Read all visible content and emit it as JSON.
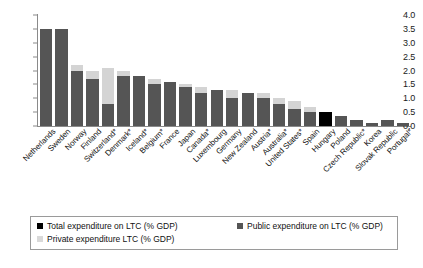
{
  "chart_data": {
    "type": "bar",
    "title": "",
    "xlabel": "",
    "ylabel": "",
    "ylim": [
      0.0,
      4.0
    ],
    "ytick_labels": [
      "4.0",
      "3.5",
      "3.0",
      "2.5",
      "2.0",
      "1.5",
      "1.0",
      "0.5",
      "0.0"
    ],
    "ytick_values": [
      4.0,
      3.5,
      3.0,
      2.5,
      2.0,
      1.5,
      1.0,
      0.5,
      0.0
    ],
    "grid": false,
    "stacked": true,
    "legend_position": "bottom",
    "categories": [
      "Netherlands",
      "Sweden",
      "Norway",
      "Finland",
      "Switzerland*",
      "Denmark*",
      "Iceland*",
      "Belgium*",
      "France",
      "Japan",
      "Canada*",
      "Luxembourg",
      "Germany",
      "New Zealand",
      "Austria*",
      "Australia*",
      "United States*",
      "Spain",
      "Hungary",
      "Poland",
      "Czech Republic*",
      "Korea",
      "Slovak Republic",
      "Portugal*"
    ],
    "series": [
      {
        "name": "Public expenditure on LTC (% GDP)",
        "color": "#555555",
        "values": [
          3.5,
          3.5,
          2.0,
          1.7,
          0.8,
          1.8,
          1.8,
          1.5,
          1.6,
          1.4,
          1.2,
          1.3,
          1.0,
          1.2,
          1.0,
          0.8,
          0.6,
          0.5,
          null,
          0.35,
          0.2,
          0.1,
          0.2,
          0.1
        ]
      },
      {
        "name": "Private expenditure LTC (% GDP)",
        "color": "#d4d4d4",
        "values": [
          0.0,
          0.0,
          0.2,
          0.3,
          1.3,
          0.2,
          0.0,
          0.2,
          0.0,
          0.1,
          0.2,
          0.0,
          0.3,
          0.0,
          0.2,
          0.2,
          0.3,
          0.2,
          null,
          0.0,
          0.0,
          0.0,
          0.0,
          0.0
        ]
      },
      {
        "name": "Total expenditure on LTC (% GDP)",
        "color": "#000000",
        "values": [
          null,
          null,
          null,
          null,
          null,
          null,
          null,
          null,
          null,
          null,
          null,
          null,
          null,
          null,
          null,
          null,
          null,
          null,
          0.5,
          null,
          null,
          null,
          null,
          null
        ]
      }
    ],
    "totals": [
      3.5,
      3.5,
      2.2,
      2.0,
      2.1,
      2.0,
      1.8,
      1.7,
      1.6,
      1.5,
      1.4,
      1.3,
      1.3,
      1.2,
      1.2,
      1.0,
      0.9,
      0.7,
      0.5,
      0.35,
      0.2,
      0.1,
      0.2,
      0.1
    ]
  },
  "legend": {
    "items": [
      {
        "label": "Total expenditure on LTC (% GDP)",
        "color": "#000000",
        "swatch_class": "sw-total"
      },
      {
        "label": "Public expenditure on LTC (% GDP)",
        "color": "#555555",
        "swatch_class": "sw-public"
      },
      {
        "label": "Private expenditure LTC (% GDP)",
        "color": "#d9d9d9",
        "swatch_class": "sw-private"
      }
    ]
  }
}
